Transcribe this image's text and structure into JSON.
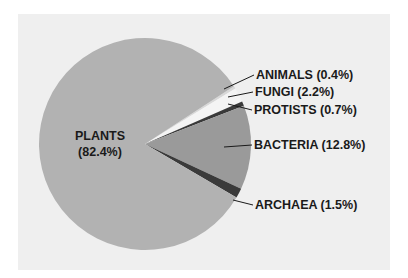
{
  "chart_data": {
    "type": "pie",
    "title": "",
    "categories": [
      "ANIMALS",
      "FUNGI",
      "PROTISTS",
      "BACTERIA",
      "ARCHAEA",
      "PLANTS"
    ],
    "values": [
      0.4,
      2.2,
      0.7,
      12.8,
      1.5,
      82.4
    ],
    "unit": "%",
    "colors": [
      "#d8d8d8",
      "#f4f4f4",
      "#3a3a3a",
      "#9a9a9a",
      "#3a3a3a",
      "#b2b2b2"
    ],
    "labels": [
      {
        "text": "ANIMALS (0.4%)"
      },
      {
        "text": "FUNGI (2.2%)"
      },
      {
        "text": "PROTISTS (0.7%)"
      },
      {
        "text": "BACTERIA (12.8%)"
      },
      {
        "text": "ARCHAEA (1.5%)"
      },
      {
        "text": "PLANTS",
        "sub": "(82.4%)"
      }
    ],
    "legend": "none (leader-line labels)"
  }
}
